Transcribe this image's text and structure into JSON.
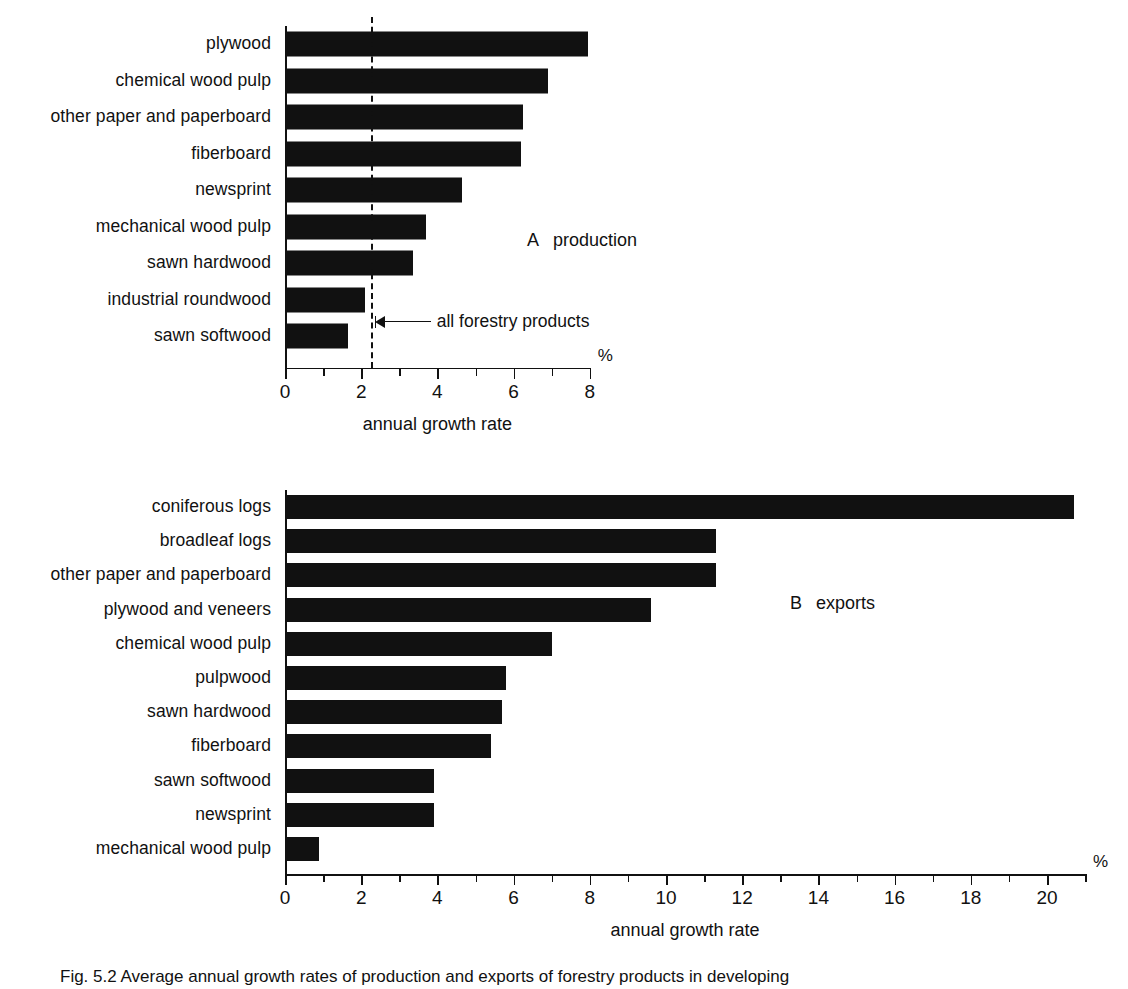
{
  "chart_data": [
    {
      "type": "bar",
      "orientation": "horizontal",
      "panel": "A",
      "title": "production",
      "xlabel": "annual growth rate",
      "unit": "%",
      "xlim": [
        0,
        8
      ],
      "xticks": [
        0,
        1,
        2,
        3,
        4,
        5,
        6,
        7,
        8
      ],
      "xticklabels": [
        "0",
        "",
        "2",
        "",
        "4",
        "",
        "6",
        "",
        "8"
      ],
      "grid": false,
      "categories": [
        "plywood",
        "chemical wood pulp",
        "other paper and paperboard",
        "fiberboard",
        "newsprint",
        "mechanical wood pulp",
        "sawn hardwood",
        "industrial roundwood",
        "sawn softwood"
      ],
      "values": [
        7.95,
        6.9,
        6.25,
        6.2,
        4.65,
        3.7,
        3.35,
        2.1,
        1.65
      ],
      "reference_line": {
        "value": 2.25,
        "label": "all forestry products",
        "style": "dashed"
      }
    },
    {
      "type": "bar",
      "orientation": "horizontal",
      "panel": "B",
      "title": "exports",
      "xlabel": "annual growth rate",
      "unit": "%",
      "xlim": [
        0,
        21
      ],
      "xticks": [
        0,
        1,
        2,
        3,
        4,
        5,
        6,
        7,
        8,
        9,
        10,
        11,
        12,
        13,
        14,
        15,
        16,
        17,
        18,
        19,
        20,
        21
      ],
      "xticklabels": [
        "0",
        "",
        "2",
        "",
        "4",
        "",
        "6",
        "",
        "8",
        "",
        "10",
        "",
        "12",
        "",
        "14",
        "",
        "16",
        "",
        "18",
        "",
        "20",
        ""
      ],
      "grid": false,
      "categories": [
        "coniferous logs",
        "broadleaf logs",
        "other paper and paperboard",
        "plywood and veneers",
        "chemical wood pulp",
        "pulpwood",
        "sawn hardwood",
        "fiberboard",
        "sawn softwood",
        "newsprint",
        "mechanical wood pulp"
      ],
      "values": [
        20.7,
        11.3,
        11.3,
        9.6,
        7.0,
        5.8,
        5.7,
        5.4,
        3.9,
        3.9,
        0.9
      ]
    }
  ],
  "colors": {
    "bar": "#111111",
    "axis": "#111111",
    "background": "#ffffff"
  },
  "caption": "Fig. 5.2 Average annual growth rates of production and exports of forestry products in developing"
}
